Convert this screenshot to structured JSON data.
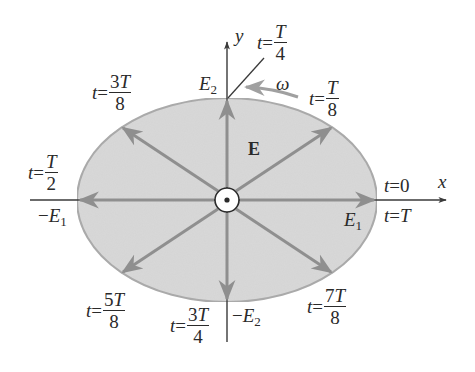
{
  "diagram": {
    "type": "elliptical-polarization",
    "colors": {
      "ellipse_fill": "#d9d9d9",
      "ellipse_stroke": "#a8a8a8",
      "vector": "#8f8f8f",
      "axis": "#3a3a3a",
      "text": "#2a2a2a"
    },
    "axes": {
      "x_label": "x",
      "y_label": "y"
    },
    "field_label": "E",
    "rotation_label": "ω",
    "amplitude_labels": {
      "E1": {
        "base": "E",
        "sub": "1",
        "sign": ""
      },
      "minus_E1": {
        "base": "E",
        "sub": "1",
        "sign": "−"
      },
      "E2": {
        "base": "E",
        "sub": "2",
        "sign": ""
      },
      "minus_E2": {
        "base": "E",
        "sub": "2",
        "sign": "−"
      }
    },
    "time_labels": [
      {
        "id": "t0",
        "var": "t",
        "eq": "=",
        "value": "0"
      },
      {
        "id": "tT",
        "var": "t",
        "eq": "=",
        "value": "T"
      },
      {
        "id": "tT8",
        "var": "t",
        "eq": "=",
        "num": "T",
        "den": "8"
      },
      {
        "id": "tT4",
        "var": "t",
        "eq": "=",
        "num": "T",
        "den": "4"
      },
      {
        "id": "t3T8",
        "var": "t",
        "eq": "=",
        "num_coef": "3",
        "num": "T",
        "den": "8"
      },
      {
        "id": "tT2",
        "var": "t",
        "eq": "=",
        "num": "T",
        "den": "2"
      },
      {
        "id": "t5T8",
        "var": "t",
        "eq": "=",
        "num_coef": "5",
        "num": "T",
        "den": "8"
      },
      {
        "id": "t3T4",
        "var": "t",
        "eq": "=",
        "num_coef": "3",
        "num": "T",
        "den": "4"
      },
      {
        "id": "t7T8",
        "var": "t",
        "eq": "=",
        "num_coef": "7",
        "num": "T",
        "den": "8"
      }
    ],
    "wave_direction_symbol": "out-of-page (dot in circle)"
  }
}
